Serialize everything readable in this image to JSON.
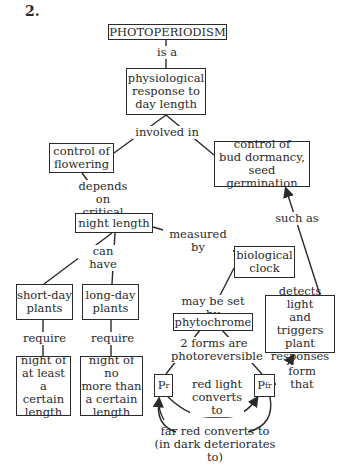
{
  "problem_number": "2.",
  "nodes": {
    "photoperiodism": "PHOTOPERIODISM",
    "physiological": "physiological\nresponse to\nday length",
    "flowering": "control of\nflowering",
    "bud": "control of\nbud dormancy,\nseed germination",
    "night_length": "night length",
    "bio_clock": "biological\nclock",
    "short_day": "short-day\nplants",
    "long_day": "long-day\nplants",
    "phytochrome": "phytochrome",
    "detects": "detects light\nand triggers\nplant\nresponses",
    "night_at_least": "night of\nat least a\ncertain\nlength",
    "night_no_more": "night of no\nmore than\na certain\nlength",
    "pr_base": "P",
    "pr_sub": "r",
    "pfr_base": "P",
    "pfr_sub": "fr"
  },
  "links": {
    "is_a": "is a",
    "involved_in": "involved in",
    "depends_on": "depends on\ncritical",
    "such_as": "such as",
    "measured_by": "measured by",
    "can_have": "can have",
    "may_be_set_by": "may be set by",
    "require_1": "require",
    "require_2": "require",
    "two_forms": "2 forms are\nphotoreversible",
    "form_that": "form that",
    "red_light": "red light\nconverts\nto",
    "far_red": "far red converts to\n(in dark deteriorates to)"
  }
}
